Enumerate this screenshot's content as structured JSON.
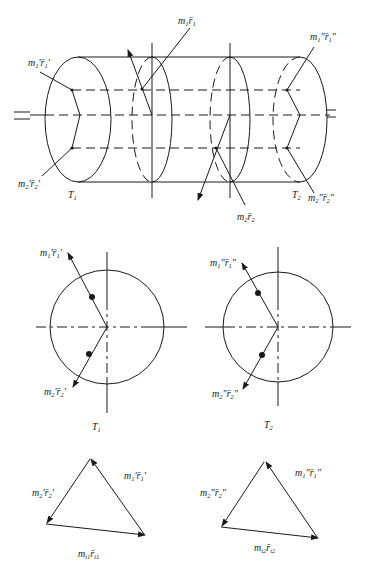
{
  "figure": {
    "top_view": {
      "labels": {
        "m1F1_prime": {
          "main": "m",
          "sub1": "1",
          "text": "'r̄",
          "sub2": "1",
          "tail": "'"
        },
        "m2F2_prime": {
          "main": "m",
          "sub1": "2",
          "text": "'r̄",
          "sub2": "2",
          "tail": "'"
        },
        "m1r1": {
          "main": "m",
          "sub1": "1",
          "text": "r̄",
          "sub2": "1"
        },
        "m2r2": {
          "main": "m",
          "sub1": "2",
          "text": "r̄",
          "sub2": "2"
        },
        "m1F1_dprime": {
          "main": "m",
          "sub1": "1",
          "text": "\"r̄",
          "sub2": "1",
          "tail": "\""
        },
        "m2F2_dprime": {
          "main": "m",
          "sub1": "2",
          "text": "\"r̄",
          "sub2": "2",
          "tail": "\""
        },
        "T1": {
          "main": "T",
          "sub": "1"
        },
        "T2": {
          "main": "T",
          "sub": "2"
        }
      },
      "shaft_symbol": "="
    },
    "plane_views": [
      {
        "name": "T",
        "sub": "1",
        "vec1": {
          "main": "m",
          "sub1": "1",
          "text": "'r̄",
          "sub2": "1",
          "tail": "'"
        },
        "vec2": {
          "main": "m",
          "sub1": "2",
          "text": "'r̄",
          "sub2": "2",
          "tail": "'"
        }
      },
      {
        "name": "T",
        "sub": "2",
        "vec1": {
          "main": "m",
          "sub1": "1",
          "text": "\"r̄",
          "sub2": "1",
          "tail": "\""
        },
        "vec2": {
          "main": "m",
          "sub1": "2",
          "text": "\"r̄",
          "sub2": "2",
          "tail": "\""
        }
      }
    ],
    "vector_polygons": [
      {
        "side_a": {
          "main": "m",
          "sub1": "2",
          "text": "'r̄",
          "sub2": "2",
          "tail": "'"
        },
        "side_b": {
          "main": "m",
          "sub1": "1",
          "text": "'r̄",
          "sub2": "1",
          "tail": "'"
        },
        "closing": {
          "main": "m",
          "sub1": "t1",
          "text": "r̄",
          "sub2": "t1"
        }
      },
      {
        "side_a": {
          "main": "m",
          "sub1": "2",
          "text": "\"r̄",
          "sub2": "2",
          "tail": "\""
        },
        "side_b": {
          "main": "m",
          "sub1": "1",
          "text": "\"r̄",
          "sub2": "1",
          "tail": "\""
        },
        "closing": {
          "main": "m",
          "sub1": "t2",
          "text": "r̄",
          "sub2": "t2"
        }
      }
    ]
  }
}
